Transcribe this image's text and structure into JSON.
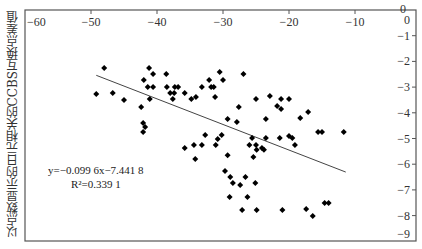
{
  "chart_data": {
    "type": "scatter",
    "title": "",
    "xlabel": "",
    "ylabel": "以点数显示的日元相关的CCBS互换点差值",
    "xlim": [
      -60,
      0
    ],
    "ylim": [
      -9,
      0
    ],
    "x_ticks": [
      -60,
      -50,
      -40,
      -30,
      -20,
      -10,
      0
    ],
    "x_tick_labels": [
      "−60",
      "−50",
      "−40",
      "−30",
      "−20",
      "−10",
      "0"
    ],
    "y_ticks": [
      0,
      -1,
      -2,
      -3,
      -4,
      -5,
      -6,
      -7,
      -8,
      -9
    ],
    "y_tick_labels": [
      "0",
      "−1",
      "−2",
      "−3",
      "−4",
      "−5",
      "−6",
      "−7",
      "−8",
      "−9"
    ],
    "x_axis_position": "top",
    "y_axis_position": "right",
    "grid": false,
    "legend": null,
    "marker": "diamond",
    "marker_color": "#000000",
    "trendline": {
      "type": "linear",
      "slope": -0.0996,
      "intercept": -7.4418,
      "r_squared": 0.3391,
      "x_start": -49.2,
      "x_end": -11.4,
      "equation_label": "y=−0.099 6x−7.441 8",
      "r2_label": "R²=0.339 1",
      "color": "#444444"
    },
    "points": [
      {
        "x": -48.0,
        "y": -2.26
      },
      {
        "x": -49.2,
        "y": -3.27
      },
      {
        "x": -46.7,
        "y": -3.23
      },
      {
        "x": -45.0,
        "y": -3.5
      },
      {
        "x": -42.4,
        "y": -3.77
      },
      {
        "x": -42.1,
        "y": -4.4
      },
      {
        "x": -41.8,
        "y": -4.55
      },
      {
        "x": -42.1,
        "y": -4.75
      },
      {
        "x": -41.2,
        "y": -2.26
      },
      {
        "x": -42.0,
        "y": -2.72
      },
      {
        "x": -40.6,
        "y": -2.49
      },
      {
        "x": -41.4,
        "y": -3.0
      },
      {
        "x": -40.6,
        "y": -3.0
      },
      {
        "x": -41.1,
        "y": -3.46
      },
      {
        "x": -38.6,
        "y": -2.49
      },
      {
        "x": -38.5,
        "y": -3.0
      },
      {
        "x": -38.0,
        "y": -3.23
      },
      {
        "x": -37.4,
        "y": -3.23
      },
      {
        "x": -37.6,
        "y": -3.46
      },
      {
        "x": -37.3,
        "y": -3.0
      },
      {
        "x": -36.8,
        "y": -3.0
      },
      {
        "x": -35.8,
        "y": -3.23
      },
      {
        "x": -34.8,
        "y": -3.46
      },
      {
        "x": -34.1,
        "y": -3.39
      },
      {
        "x": -33.2,
        "y": -3.0
      },
      {
        "x": -32.1,
        "y": -2.72
      },
      {
        "x": -31.8,
        "y": -3.0
      },
      {
        "x": -31.4,
        "y": -3.0
      },
      {
        "x": -31.2,
        "y": -3.39
      },
      {
        "x": -30.5,
        "y": -2.41
      },
      {
        "x": -30.0,
        "y": -2.72
      },
      {
        "x": -29.3,
        "y": -4.24
      },
      {
        "x": -26.9,
        "y": -2.49
      },
      {
        "x": -25.0,
        "y": -3.46
      },
      {
        "x": -22.9,
        "y": -3.35
      },
      {
        "x": -21.2,
        "y": -3.46
      },
      {
        "x": -20.0,
        "y": -3.46
      },
      {
        "x": -21.8,
        "y": -3.74
      },
      {
        "x": -21.2,
        "y": -3.85
      },
      {
        "x": -27.6,
        "y": -3.77
      },
      {
        "x": -27.9,
        "y": -4.36
      },
      {
        "x": -23.5,
        "y": -4.24
      },
      {
        "x": -18.3,
        "y": -4.2
      },
      {
        "x": -17.1,
        "y": -3.97
      },
      {
        "x": -15.6,
        "y": -4.75
      },
      {
        "x": -15.0,
        "y": -4.75
      },
      {
        "x": -11.7,
        "y": -4.75
      },
      {
        "x": -30.2,
        "y": -4.86
      },
      {
        "x": -32.7,
        "y": -4.86
      },
      {
        "x": -30.8,
        "y": -5.02
      },
      {
        "x": -25.6,
        "y": -4.98
      },
      {
        "x": -25.0,
        "y": -5.25
      },
      {
        "x": -24.9,
        "y": -5.44
      },
      {
        "x": -19.5,
        "y": -4.98
      },
      {
        "x": -19.1,
        "y": -5.25
      },
      {
        "x": -23.5,
        "y": -4.98
      },
      {
        "x": -21.4,
        "y": -4.98
      },
      {
        "x": -20.0,
        "y": -4.9
      },
      {
        "x": -26.0,
        "y": -5.25
      },
      {
        "x": -25.4,
        "y": -5.72
      },
      {
        "x": -24.1,
        "y": -5.37
      },
      {
        "x": -23.8,
        "y": -5.44
      },
      {
        "x": -35.8,
        "y": -5.37
      },
      {
        "x": -34.4,
        "y": -5.25
      },
      {
        "x": -31.1,
        "y": -5.25
      },
      {
        "x": -29.3,
        "y": -5.65
      },
      {
        "x": -33.2,
        "y": -5.25
      },
      {
        "x": -34.2,
        "y": -5.8
      },
      {
        "x": -29.7,
        "y": -6.26
      },
      {
        "x": -28.9,
        "y": -6.5
      },
      {
        "x": -28.5,
        "y": -6.73
      },
      {
        "x": -27.4,
        "y": -6.81
      },
      {
        "x": -26.6,
        "y": -6.5
      },
      {
        "x": -25.1,
        "y": -6.73
      },
      {
        "x": -29.0,
        "y": -7.28
      },
      {
        "x": -26.3,
        "y": -7.28
      },
      {
        "x": -27.1,
        "y": -7.78
      },
      {
        "x": -24.9,
        "y": -7.78
      },
      {
        "x": -21.0,
        "y": -7.78
      },
      {
        "x": -17.4,
        "y": -7.74
      },
      {
        "x": -16.4,
        "y": -8.02
      },
      {
        "x": -14.6,
        "y": -7.51
      },
      {
        "x": -14.0,
        "y": -7.51
      }
    ]
  }
}
